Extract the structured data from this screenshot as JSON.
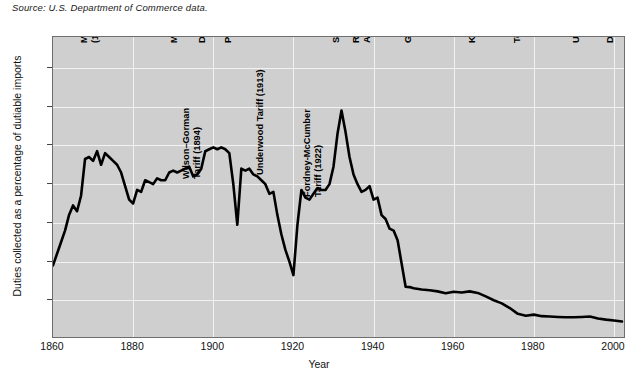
{
  "source_note": "Source: U.S. Department of Commerce data.",
  "chart_data": {
    "type": "line",
    "title": "",
    "xlabel": "Year",
    "ylabel": "Duties collected as a percentage of dutiable imports",
    "xlim": [
      1860,
      2003
    ],
    "ylim": [
      0,
      78
    ],
    "grid": true,
    "legend": null,
    "xticks": [
      1860,
      1880,
      1900,
      1920,
      1940,
      1960,
      1980,
      2000
    ],
    "yticks": [
      10,
      20,
      30,
      40,
      50,
      60,
      70
    ],
    "series": [
      {
        "name": "Duties collected as a percentage of dutiable imports",
        "x": [
          1860,
          1862,
          1863,
          1864,
          1865,
          1866,
          1867,
          1868,
          1869,
          1870,
          1871,
          1872,
          1873,
          1874,
          1875,
          1876,
          1877,
          1878,
          1879,
          1880,
          1881,
          1882,
          1883,
          1884,
          1885,
          1886,
          1887,
          1888,
          1889,
          1890,
          1891,
          1892,
          1893,
          1894,
          1895,
          1896,
          1897,
          1898,
          1899,
          1900,
          1901,
          1902,
          1903,
          1904,
          1905,
          1906,
          1907,
          1908,
          1909,
          1910,
          1911,
          1912,
          1913,
          1914,
          1915,
          1916,
          1917,
          1918,
          1919,
          1920,
          1921,
          1922,
          1923,
          1924,
          1925,
          1926,
          1927,
          1928,
          1929,
          1930,
          1931,
          1932,
          1933,
          1934,
          1935,
          1936,
          1937,
          1938,
          1939,
          1940,
          1941,
          1942,
          1943,
          1944,
          1945,
          1946,
          1947,
          1948,
          1949,
          1950,
          1952,
          1954,
          1956,
          1958,
          1960,
          1962,
          1964,
          1966,
          1968,
          1970,
          1972,
          1974,
          1976,
          1978,
          1980,
          1982,
          1984,
          1986,
          1988,
          1990,
          1992,
          1994,
          1996,
          1998,
          2000,
          2002
        ],
        "values": [
          19.0,
          25.0,
          28.0,
          32.0,
          34.5,
          33.0,
          37.0,
          46.5,
          47.0,
          46.0,
          48.5,
          45.0,
          48.0,
          47.0,
          46.0,
          45.0,
          43.0,
          39.5,
          36.0,
          35.0,
          38.5,
          38.0,
          41.0,
          40.5,
          40.0,
          41.5,
          41.0,
          41.0,
          43.0,
          43.5,
          43.0,
          43.5,
          44.0,
          44.5,
          42.0,
          42.5,
          44.0,
          48.5,
          49.0,
          49.5,
          49.0,
          49.5,
          49.0,
          48.0,
          40.0,
          29.5,
          44.0,
          43.5,
          44.0,
          42.5,
          42.0,
          41.0,
          40.0,
          37.5,
          38.0,
          32.0,
          27.0,
          23.0,
          20.0,
          16.5,
          29.5,
          38.5,
          36.5,
          36.0,
          37.5,
          39.0,
          38.5,
          38.5,
          40.0,
          44.5,
          53.0,
          59.0,
          53.5,
          47.0,
          42.5,
          40.0,
          38.0,
          38.5,
          39.5,
          36.0,
          36.5,
          32.0,
          31.0,
          28.5,
          28.0,
          25.5,
          19.5,
          13.5,
          13.4,
          13.1,
          12.8,
          12.6,
          12.3,
          11.8,
          12.2,
          12.0,
          12.3,
          11.9,
          11.0,
          10.0,
          9.2,
          8.0,
          6.5,
          6.0,
          6.3,
          5.9,
          5.8,
          5.7,
          5.6,
          5.6,
          5.7,
          5.8,
          5.3,
          5.0,
          4.8,
          4.5
        ]
      }
    ],
    "annotations": [
      {
        "label": "Morrill and War Tariffs\n(1861–1864)",
        "line1": "Morrill and War Tariffs",
        "line2": "(1861–1864)",
        "year": 1862,
        "x_px": 78,
        "bottom_px": 42,
        "lines": 2
      },
      {
        "label": "McKinley Tariff (1890)",
        "line1": "McKinley Tariff (1890)",
        "line2": "",
        "year": 1890,
        "x_px": 168,
        "bottom_px": 42,
        "lines": 1
      },
      {
        "label": "Wilson–Gorman Tariff (1894)",
        "line1": "Wilson–Gorman",
        "line2": "Tariff (1894)",
        "year": 1894,
        "x_px": 180,
        "bottom_px": 178,
        "lines": 2
      },
      {
        "label": "Dingley Tariff (1897)",
        "line1": "Dingley Tariff (1897)",
        "line2": "",
        "year": 1897,
        "x_px": 196,
        "bottom_px": 42,
        "lines": 1
      },
      {
        "label": "Payne–Aldrich Tariff (1909)",
        "line1": "Payne–Aldrich Tariff (1909)",
        "line2": "",
        "year": 1909,
        "x_px": 222,
        "bottom_px": 42,
        "lines": 1
      },
      {
        "label": "Underwood Tariff (1913)",
        "line1": "Underwood Tariff (1913)",
        "line2": "",
        "year": 1913,
        "x_px": 254,
        "bottom_px": 174,
        "lines": 1
      },
      {
        "label": "Fordney–McCumber Tariff (1922)",
        "line1": "Fordney-McCumber",
        "line2": "Tariff (1922)",
        "year": 1922,
        "x_px": 301,
        "bottom_px": 196,
        "lines": 2
      },
      {
        "label": "Smoot–Hawley Tariff (1930)",
        "line1": "Smoot-Hawley Tariff (1930)",
        "line2": "",
        "year": 1930,
        "x_px": 330,
        "bottom_px": 42,
        "lines": 1
      },
      {
        "label": "Reciprocal Trade Agreements Act (1934)",
        "line1": "Reciprocal Trade",
        "line2": "Agreements Act (1934)",
        "year": 1934,
        "x_px": 350,
        "bottom_px": 42,
        "lines": 2
      },
      {
        "label": "GATT (1947)",
        "line1": "GATT (1947)",
        "line2": "",
        "year": 1947,
        "x_px": 402,
        "bottom_px": 42,
        "lines": 1
      },
      {
        "label": "Kennedy Round of GATT (1967)",
        "line1": "Kennedy Round of GATT (1967)",
        "line2": "",
        "year": 1967,
        "x_px": 466,
        "bottom_px": 42,
        "lines": 1
      },
      {
        "label": "Tokyo Round of GATT (1979)",
        "line1": "Tokyo Round of GATT (1979)",
        "line2": "",
        "year": 1979,
        "x_px": 511,
        "bottom_px": 42,
        "lines": 1
      },
      {
        "label": "Uruguay Round of GATT (1993)",
        "line1": "Uruguay Round of GATT (1993)",
        "line2": "",
        "year": 1993,
        "x_px": 570,
        "bottom_px": 42,
        "lines": 1
      },
      {
        "label": "Doha Round of WTO begins (2001)",
        "line1": "Doha Round of WTO begins (2001)",
        "line2": "",
        "year": 2001,
        "x_px": 604,
        "bottom_px": 42,
        "lines": 1
      }
    ],
    "style": {
      "plot_background": "#cfcfcf",
      "line_color": "#000000",
      "gridline_color": "#f2f2f2",
      "frame_color": "#6e6e6e"
    }
  }
}
